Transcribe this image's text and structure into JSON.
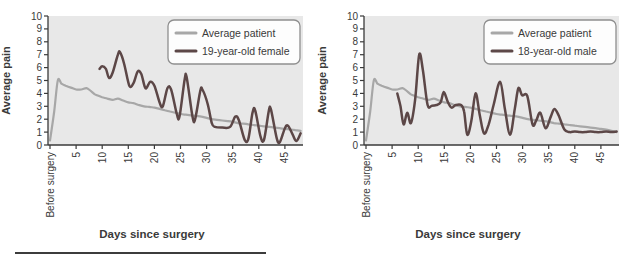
{
  "figure": {
    "background": "#ffffff",
    "divider": {
      "color": "#3c3c3c"
    }
  },
  "chart_data": [
    {
      "type": "line",
      "title": "",
      "xlabel": "Days since surgery",
      "ylabel": "Average pain",
      "ylim": [
        0,
        10
      ],
      "xlim": [
        0,
        48.5
      ],
      "yticks": [
        0,
        1,
        2,
        3,
        4,
        5,
        6,
        7,
        8,
        9,
        10
      ],
      "xticks": [
        {
          "value": 0,
          "label": "Before surgery"
        },
        {
          "value": 5,
          "label": "5"
        },
        {
          "value": 10,
          "label": "10"
        },
        {
          "value": 15,
          "label": "15"
        },
        {
          "value": 20,
          "label": "20"
        },
        {
          "value": 25,
          "label": "25"
        },
        {
          "value": 30,
          "label": "30"
        },
        {
          "value": 35,
          "label": "35"
        },
        {
          "value": 40,
          "label": "40"
        },
        {
          "value": 45,
          "label": "45"
        }
      ],
      "grid": false,
      "plot_bg": "#e8e8e8",
      "axis_color": "#3a3a3a",
      "legend_position": "top-right",
      "series": [
        {
          "name": "Average patient",
          "color": "#a7a7a7",
          "points": [
            [
              0,
              0.35
            ],
            [
              0.8,
              2.6
            ],
            [
              1.5,
              5.0
            ],
            [
              2.2,
              4.75
            ],
            [
              3,
              4.6
            ],
            [
              4,
              4.45
            ],
            [
              5,
              4.3
            ],
            [
              6,
              4.3
            ],
            [
              7,
              4.4
            ],
            [
              7.8,
              4.2
            ],
            [
              8.5,
              3.95
            ],
            [
              9,
              3.85
            ],
            [
              10,
              3.7
            ],
            [
              11,
              3.6
            ],
            [
              12,
              3.5
            ],
            [
              13,
              3.6
            ],
            [
              14,
              3.45
            ],
            [
              15,
              3.3
            ],
            [
              16,
              3.25
            ],
            [
              17,
              3.1
            ],
            [
              18,
              3.0
            ],
            [
              19,
              2.95
            ],
            [
              20,
              2.9
            ],
            [
              21,
              2.8
            ],
            [
              22,
              2.7
            ],
            [
              23,
              2.6
            ],
            [
              24,
              2.5
            ],
            [
              25,
              2.4
            ],
            [
              26,
              2.35
            ],
            [
              27,
              2.3
            ],
            [
              28,
              2.25
            ],
            [
              29,
              2.2
            ],
            [
              30,
              2.1
            ],
            [
              31,
              2.0
            ],
            [
              32,
              1.95
            ],
            [
              33,
              1.9
            ],
            [
              34,
              1.85
            ],
            [
              35,
              1.8
            ],
            [
              36,
              1.7
            ],
            [
              37,
              1.65
            ],
            [
              38,
              1.6
            ],
            [
              39,
              1.55
            ],
            [
              40,
              1.5
            ],
            [
              41,
              1.45
            ],
            [
              42,
              1.4
            ],
            [
              43,
              1.35
            ],
            [
              44,
              1.3
            ],
            [
              45,
              1.25
            ],
            [
              46,
              1.2
            ],
            [
              47,
              1.15
            ],
            [
              48,
              1.1
            ]
          ]
        },
        {
          "name": "19-year-old female",
          "color": "#5c4747",
          "points": [
            [
              9.5,
              5.9
            ],
            [
              10,
              6.1
            ],
            [
              10.7,
              5.9
            ],
            [
              11.3,
              5.2
            ],
            [
              12,
              5.6
            ],
            [
              13,
              7.0
            ],
            [
              13.4,
              7.2
            ],
            [
              14.2,
              6.3
            ],
            [
              15.2,
              4.6
            ],
            [
              16,
              4.8
            ],
            [
              16.8,
              5.7
            ],
            [
              17.5,
              5.5
            ],
            [
              18.3,
              4.4
            ],
            [
              19.2,
              4.9
            ],
            [
              20,
              4.6
            ],
            [
              21,
              3.3
            ],
            [
              21.6,
              3.0
            ],
            [
              22.5,
              4.4
            ],
            [
              23.2,
              4.3
            ],
            [
              24.3,
              2.4
            ],
            [
              24.8,
              2.2
            ],
            [
              25.8,
              5.1
            ],
            [
              26.2,
              5.2
            ],
            [
              27.3,
              2.2
            ],
            [
              27.8,
              2.0
            ],
            [
              28.8,
              4.2
            ],
            [
              29.2,
              4.3
            ],
            [
              30.2,
              3.2
            ],
            [
              31,
              1.7
            ],
            [
              31.6,
              1.4
            ],
            [
              33,
              1.35
            ],
            [
              34.5,
              1.4
            ],
            [
              35.5,
              2.2
            ],
            [
              36.2,
              1.9
            ],
            [
              37.3,
              0.4
            ],
            [
              38,
              0.5
            ],
            [
              38.8,
              2.5
            ],
            [
              39.3,
              2.7
            ],
            [
              40.3,
              0.7
            ],
            [
              41,
              0.4
            ],
            [
              41.9,
              2.6
            ],
            [
              42.3,
              2.8
            ],
            [
              43.4,
              0.6
            ],
            [
              44,
              0.2
            ],
            [
              45,
              1.3
            ],
            [
              45.6,
              1.5
            ],
            [
              46.5,
              0.8
            ],
            [
              47.2,
              0.3
            ],
            [
              48,
              0.9
            ]
          ]
        }
      ]
    },
    {
      "type": "line",
      "title": "",
      "xlabel": "Days since surgery",
      "ylabel": "Average pain",
      "ylim": [
        0,
        10
      ],
      "xlim": [
        0,
        48.5
      ],
      "yticks": [
        0,
        1,
        2,
        3,
        4,
        5,
        6,
        7,
        8,
        9,
        10
      ],
      "xticks": [
        {
          "value": 0,
          "label": "Before surgery"
        },
        {
          "value": 5,
          "label": "5"
        },
        {
          "value": 10,
          "label": "10"
        },
        {
          "value": 15,
          "label": "15"
        },
        {
          "value": 20,
          "label": "20"
        },
        {
          "value": 25,
          "label": "25"
        },
        {
          "value": 30,
          "label": "30"
        },
        {
          "value": 35,
          "label": "35"
        },
        {
          "value": 40,
          "label": "40"
        },
        {
          "value": 45,
          "label": "45"
        }
      ],
      "grid": false,
      "plot_bg": "#e8e8e8",
      "axis_color": "#3a3a3a",
      "legend_position": "top-right",
      "series": [
        {
          "name": "Average patient",
          "color": "#a7a7a7",
          "points": [
            [
              0,
              0.35
            ],
            [
              0.8,
              2.6
            ],
            [
              1.5,
              5.0
            ],
            [
              2.2,
              4.75
            ],
            [
              3,
              4.6
            ],
            [
              4,
              4.45
            ],
            [
              5,
              4.3
            ],
            [
              6,
              4.3
            ],
            [
              7,
              4.4
            ],
            [
              7.8,
              4.2
            ],
            [
              8.5,
              3.95
            ],
            [
              9,
              3.85
            ],
            [
              10,
              3.7
            ],
            [
              11,
              3.6
            ],
            [
              12,
              3.5
            ],
            [
              13,
              3.6
            ],
            [
              14,
              3.45
            ],
            [
              15,
              3.3
            ],
            [
              16,
              3.25
            ],
            [
              17,
              3.1
            ],
            [
              18,
              3.0
            ],
            [
              19,
              2.95
            ],
            [
              20,
              2.9
            ],
            [
              21,
              2.8
            ],
            [
              22,
              2.7
            ],
            [
              23,
              2.6
            ],
            [
              24,
              2.5
            ],
            [
              25,
              2.4
            ],
            [
              26,
              2.35
            ],
            [
              27,
              2.3
            ],
            [
              28,
              2.25
            ],
            [
              29,
              2.2
            ],
            [
              30,
              2.1
            ],
            [
              31,
              2.0
            ],
            [
              32,
              1.95
            ],
            [
              33,
              1.9
            ],
            [
              34,
              1.85
            ],
            [
              35,
              1.8
            ],
            [
              36,
              1.7
            ],
            [
              37,
              1.65
            ],
            [
              38,
              1.6
            ],
            [
              39,
              1.55
            ],
            [
              40,
              1.5
            ],
            [
              41,
              1.45
            ],
            [
              42,
              1.4
            ],
            [
              43,
              1.35
            ],
            [
              44,
              1.3
            ],
            [
              45,
              1.25
            ],
            [
              46,
              1.2
            ],
            [
              47,
              1.1
            ],
            [
              48,
              1.0
            ]
          ]
        },
        {
          "name": "18-year-old male",
          "color": "#5c4747",
          "points": [
            [
              6,
              4.0
            ],
            [
              6.6,
              3.0
            ],
            [
              7.2,
              1.6
            ],
            [
              7.9,
              2.5
            ],
            [
              8.6,
              1.7
            ],
            [
              9.4,
              3.5
            ],
            [
              10.2,
              7.0
            ],
            [
              10.9,
              5.8
            ],
            [
              11.8,
              3.1
            ],
            [
              12.6,
              3.05
            ],
            [
              13.5,
              3.1
            ],
            [
              14.3,
              3.3
            ],
            [
              14.9,
              4.1
            ],
            [
              15.7,
              3.3
            ],
            [
              16.4,
              2.9
            ],
            [
              17.2,
              3.1
            ],
            [
              18.2,
              3.1
            ],
            [
              18.8,
              2.6
            ],
            [
              19.4,
              0.8
            ],
            [
              20.2,
              1.9
            ],
            [
              21,
              4.0
            ],
            [
              21.8,
              2.3
            ],
            [
              22.6,
              0.9
            ],
            [
              23.5,
              1.6
            ],
            [
              24.5,
              3.2
            ],
            [
              25.7,
              4.9
            ],
            [
              26.6,
              2.8
            ],
            [
              27.6,
              0.8
            ],
            [
              28.5,
              2.8
            ],
            [
              29.2,
              4.4
            ],
            [
              29.9,
              3.85
            ],
            [
              30.9,
              3.8
            ],
            [
              31.9,
              1.6
            ],
            [
              32.6,
              1.9
            ],
            [
              33.4,
              2.5
            ],
            [
              34.4,
              1.3
            ],
            [
              35.4,
              2.2
            ],
            [
              36.1,
              2.8
            ],
            [
              36.9,
              2.3
            ],
            [
              38,
              1.2
            ],
            [
              39,
              1.0
            ],
            [
              40,
              1.05
            ],
            [
              41,
              1.0
            ],
            [
              42,
              1.0
            ],
            [
              43,
              1.05
            ],
            [
              44,
              1.0
            ],
            [
              45,
              1.0
            ],
            [
              46,
              1.05
            ],
            [
              47,
              1.0
            ],
            [
              48,
              1.05
            ]
          ]
        }
      ]
    }
  ]
}
